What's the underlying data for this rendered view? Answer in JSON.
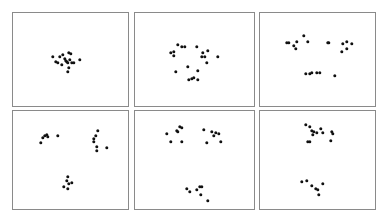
{
  "chart_data": {
    "type": "scatter",
    "title": "",
    "layout": {
      "rows": 2,
      "cols": 3,
      "grid": false,
      "axes_ticks": false,
      "legend": false
    },
    "point_color": "#111111",
    "frame_color": "#8a8a8a",
    "panels": [
      {
        "name": "panel-1",
        "box": [
          12,
          12,
          129,
          107
        ],
        "description": "single dense cluster",
        "points": [
          [
            53,
            57
          ],
          [
            56,
            62
          ],
          [
            58,
            63
          ],
          [
            62,
            65
          ],
          [
            60,
            57
          ],
          [
            63,
            55
          ],
          [
            65,
            59
          ],
          [
            67,
            62
          ],
          [
            69,
            53
          ],
          [
            71,
            54
          ],
          [
            68,
            63
          ],
          [
            72,
            63
          ],
          [
            74,
            63
          ],
          [
            69,
            68
          ],
          [
            68,
            72
          ],
          [
            80,
            60
          ],
          [
            66,
            61
          ],
          [
            70,
            60
          ]
        ]
      },
      {
        "name": "panel-2",
        "box": [
          134,
          12,
          255,
          107
        ],
        "description": "loosely spread points",
        "points": [
          [
            178,
            45
          ],
          [
            182,
            47
          ],
          [
            185,
            47
          ],
          [
            197,
            47
          ],
          [
            174,
            52
          ],
          [
            171,
            53
          ],
          [
            174,
            56
          ],
          [
            208,
            51
          ],
          [
            203,
            53
          ],
          [
            202,
            57
          ],
          [
            205,
            57
          ],
          [
            218,
            57
          ],
          [
            207,
            63
          ],
          [
            188,
            67
          ],
          [
            176,
            72
          ],
          [
            198,
            71
          ],
          [
            189,
            80
          ],
          [
            192,
            79
          ],
          [
            194,
            78
          ],
          [
            198,
            80
          ]
        ]
      },
      {
        "name": "panel-3",
        "box": [
          259,
          12,
          376,
          107
        ],
        "description": "three loose groups",
        "points": [
          [
            304,
            36
          ],
          [
            287,
            43
          ],
          [
            289,
            43
          ],
          [
            297,
            42
          ],
          [
            308,
            42
          ],
          [
            294,
            46
          ],
          [
            296,
            49
          ],
          [
            328,
            43
          ],
          [
            329,
            43
          ],
          [
            343,
            44
          ],
          [
            347,
            42
          ],
          [
            352,
            44
          ],
          [
            347,
            49
          ],
          [
            342,
            52
          ],
          [
            306,
            74
          ],
          [
            310,
            74
          ],
          [
            312,
            73
          ],
          [
            317,
            73
          ],
          [
            320,
            73
          ],
          [
            335,
            76
          ]
        ]
      },
      {
        "name": "panel-4",
        "box": [
          12,
          110,
          129,
          210
        ],
        "description": "three separated clusters",
        "points": [
          [
            47,
            135
          ],
          [
            45,
            136
          ],
          [
            48,
            137
          ],
          [
            43,
            138
          ],
          [
            41,
            143
          ],
          [
            58,
            136
          ],
          [
            98,
            131
          ],
          [
            96,
            136
          ],
          [
            94,
            139
          ],
          [
            94,
            142
          ],
          [
            97,
            147
          ],
          [
            97,
            151
          ],
          [
            107,
            148
          ],
          [
            68,
            177
          ],
          [
            67,
            181
          ],
          [
            69,
            184
          ],
          [
            72,
            183
          ],
          [
            64,
            187
          ],
          [
            68,
            189
          ]
        ]
      },
      {
        "name": "panel-5",
        "box": [
          134,
          110,
          255,
          210
        ],
        "description": "three clusters, wider separation",
        "points": [
          [
            180,
            127
          ],
          [
            182,
            128
          ],
          [
            177,
            131
          ],
          [
            178,
            132
          ],
          [
            167,
            134
          ],
          [
            171,
            142
          ],
          [
            182,
            142
          ],
          [
            204,
            130
          ],
          [
            212,
            132
          ],
          [
            216,
            133
          ],
          [
            219,
            134
          ],
          [
            214,
            136
          ],
          [
            207,
            143
          ],
          [
            221,
            142
          ],
          [
            187,
            189
          ],
          [
            190,
            192
          ],
          [
            197,
            190
          ],
          [
            200,
            187
          ],
          [
            202,
            187
          ],
          [
            201,
            195
          ],
          [
            208,
            201
          ]
        ]
      },
      {
        "name": "panel-6",
        "box": [
          259,
          110,
          376,
          210
        ],
        "description": "two clusters",
        "points": [
          [
            306,
            125
          ],
          [
            310,
            127
          ],
          [
            312,
            131
          ],
          [
            314,
            132
          ],
          [
            317,
            133
          ],
          [
            321,
            129
          ],
          [
            323,
            133
          ],
          [
            313,
            135
          ],
          [
            332,
            132
          ],
          [
            333,
            134
          ],
          [
            331,
            141
          ],
          [
            308,
            142
          ],
          [
            310,
            142
          ],
          [
            302,
            182
          ],
          [
            307,
            181
          ],
          [
            312,
            186
          ],
          [
            316,
            189
          ],
          [
            318,
            190
          ],
          [
            323,
            184
          ],
          [
            319,
            195
          ]
        ]
      }
    ]
  }
}
